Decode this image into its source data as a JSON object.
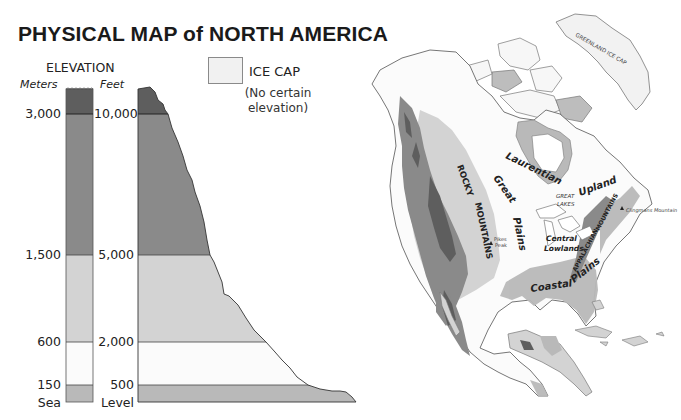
{
  "title": "PHYSICAL MAP of NORTH AMERICA",
  "legend": {
    "heading": "ELEVATION",
    "meters_label": "Meters",
    "feet_label": "Feet",
    "meters_ticks": [
      "3,000",
      "1,500",
      "600",
      "150",
      "Sea"
    ],
    "feet_ticks": [
      "10,000",
      "5,000",
      "2,000",
      "500",
      "Level"
    ],
    "bands": [
      {
        "name": "above-3000m",
        "meters_min": 3000,
        "feet_min": 10000,
        "color": "#5e5e5e"
      },
      {
        "name": "1500-3000m",
        "meters_min": 1500,
        "feet_min": 5000,
        "color": "#8a8a8a"
      },
      {
        "name": "600-1500m",
        "meters_min": 600,
        "feet_min": 2000,
        "color": "#d3d3d3"
      },
      {
        "name": "150-600m",
        "meters_min": 150,
        "feet_min": 500,
        "color": "#fbfbfb"
      },
      {
        "name": "0-150m",
        "meters_min": 0,
        "feet_min": 0,
        "color": "#b9b9b9"
      }
    ],
    "ice_cap": {
      "label": "ICE CAP",
      "note_line1": "(No certain",
      "note_line2": "elevation)",
      "color": "#f1f1f1"
    }
  },
  "map": {
    "labels": {
      "greenland": "GREENLAND ICE CAP",
      "laurentian": "Laurentian",
      "upland": "Upland",
      "great": "Great",
      "plains": "Plains",
      "rocky": "ROCKY",
      "mountains": "MOUNTAINS",
      "great_lakes_1": "GREAT",
      "great_lakes_2": "LAKES",
      "central": "Central",
      "lowlands": "Lowlands",
      "appalachian": "APPALACHIAN",
      "app_mountains": "MOUNTAINS",
      "coastal": "Coastal",
      "coastal_plains": "Plains",
      "pikes_1": "Pikes",
      "pikes_2": "Peak",
      "clingmans": "Clingmans Mountain"
    }
  }
}
